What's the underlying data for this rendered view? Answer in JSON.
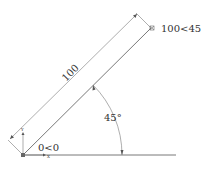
{
  "diagram": {
    "type": "cad-polar-line",
    "line_length_label": "100",
    "angle_label": "45°",
    "start_point_label": "0<0",
    "end_point_label": "100<45",
    "ucs_axis_y": "Y",
    "ucs_axis_x": "X",
    "colors": {
      "stroke": "#555555",
      "text": "#333333",
      "background": "#ffffff"
    }
  }
}
